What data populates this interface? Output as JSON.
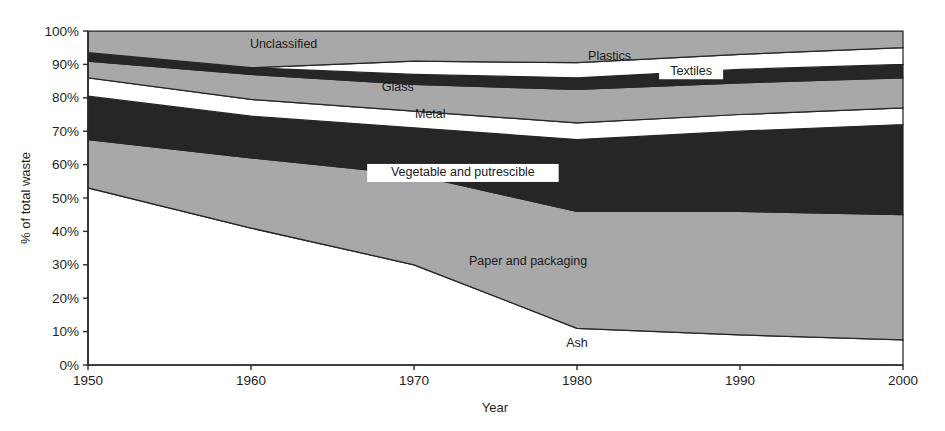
{
  "chart_data": {
    "type": "area",
    "stacked": true,
    "title": "",
    "xlabel": "Year",
    "ylabel": "% of total waste",
    "x": [
      1950,
      1960,
      1970,
      1980,
      1990,
      2000
    ],
    "xlim": [
      1950,
      2000
    ],
    "ylim": [
      0,
      100
    ],
    "xticks": [
      "1950",
      "1960",
      "1970",
      "1980",
      "1990",
      "2000"
    ],
    "yticks": [
      "0%",
      "10%",
      "20%",
      "30%",
      "40%",
      "50%",
      "60%",
      "70%",
      "80%",
      "90%",
      "100%"
    ],
    "grid": false,
    "legend_position": "inline-labels",
    "note": "Cumulative upper boundaries of each stacked band, in % of total waste, read bottom-up from the 0% baseline.",
    "series": [
      {
        "name": "Ash",
        "fill": "#ffffff",
        "label_x": 1980,
        "label_y": 6.5,
        "label_on_dark": false,
        "values": [
          53.0,
          41.0,
          30.0,
          11.0,
          9.0,
          7.5
        ],
        "cumulative_top": [
          53.0,
          41.0,
          30.0,
          11.0,
          9.0,
          7.5
        ]
      },
      {
        "name": "Paper and packaging",
        "fill": "#a8a8a8",
        "label_x": 1977,
        "label_y": 31.0,
        "label_on_dark": false,
        "values": [
          14.5,
          21.0,
          27.0,
          35.0,
          37.0,
          37.5
        ],
        "cumulative_top": [
          67.5,
          62.0,
          57.0,
          46.0,
          46.0,
          45.0
        ]
      },
      {
        "name": "Vegetable and putrescible",
        "fill": "#262626",
        "label_x": 1973,
        "label_y": 57.5,
        "label_on_dark": true,
        "values": [
          13.0,
          12.5,
          14.0,
          21.5,
          24.0,
          27.0
        ],
        "cumulative_top": [
          80.5,
          74.5,
          71.0,
          67.5,
          70.0,
          72.0
        ]
      },
      {
        "name": "Metal",
        "fill": "#ffffff",
        "label_x": 1971,
        "label_y": 75.0,
        "label_on_dark": false,
        "values": [
          5.5,
          5.0,
          5.0,
          5.0,
          5.0,
          5.0
        ],
        "cumulative_top": [
          86.0,
          79.5,
          76.0,
          72.5,
          75.0,
          77.0
        ]
      },
      {
        "name": "Glass",
        "fill": "#a8a8a8",
        "label_x": 1969,
        "label_y": 83.0,
        "label_on_dark": false,
        "values": [
          5.0,
          7.5,
          8.0,
          10.0,
          9.5,
          9.0
        ],
        "cumulative_top": [
          91.0,
          87.0,
          84.0,
          82.5,
          84.5,
          86.0
        ]
      },
      {
        "name": "Textiles",
        "fill": "#262626",
        "label_x": 1987,
        "label_y": 87.8,
        "label_on_dark": false,
        "label_plate": true,
        "values": [
          2.5,
          2.0,
          3.0,
          3.5,
          4.0,
          4.0
        ],
        "cumulative_top": [
          93.5,
          89.0,
          87.0,
          86.0,
          88.5,
          90.0
        ]
      },
      {
        "name": "Plastics",
        "fill": "#ffffff",
        "label_x": 1982,
        "label_y": 92.3,
        "label_on_dark": false,
        "values": [
          0.0,
          0.0,
          4.0,
          4.5,
          4.5,
          5.0
        ],
        "cumulative_top": [
          93.5,
          89.0,
          91.0,
          90.5,
          93.0,
          95.0
        ]
      },
      {
        "name": "Unclassified",
        "fill": "#a8a8a8",
        "label_x": 1962,
        "label_y": 96.0,
        "label_on_dark": false,
        "values": [
          6.5,
          11.0,
          9.0,
          9.5,
          7.0,
          5.0
        ],
        "cumulative_top": [
          100.0,
          100.0,
          100.0,
          100.0,
          100.0,
          100.0
        ]
      }
    ]
  },
  "axes": {
    "ylabel": "% of total waste",
    "xlabel": "Year"
  }
}
